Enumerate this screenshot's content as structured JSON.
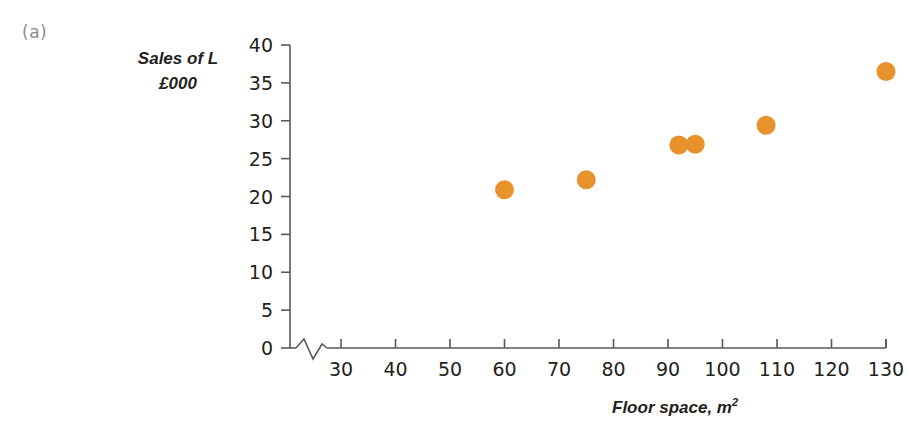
{
  "figure": {
    "panel_label": "(a)"
  },
  "chart_data": {
    "type": "scatter",
    "title": "",
    "xlabel": "Floor space, m",
    "xlabel_superscript": "2",
    "ylabel_line1": "Sales of L",
    "ylabel_line2": "£000",
    "ylabel": "Sales of L £000",
    "x": [
      60,
      75,
      92,
      95,
      108,
      130
    ],
    "values": [
      20.9,
      22.2,
      26.8,
      26.9,
      29.4,
      36.5
    ],
    "points": [
      {
        "x": 60,
        "y": 20.9
      },
      {
        "x": 75,
        "y": 22.2
      },
      {
        "x": 92,
        "y": 26.8
      },
      {
        "x": 95,
        "y": 26.9
      },
      {
        "x": 108,
        "y": 29.4
      },
      {
        "x": 130,
        "y": 36.5
      }
    ],
    "xlim": [
      25,
      130
    ],
    "ylim": [
      0,
      40
    ],
    "xticks": [
      30,
      40,
      50,
      60,
      70,
      80,
      90,
      100,
      110,
      120,
      130
    ],
    "yticks": [
      0,
      5,
      10,
      15,
      20,
      25,
      30,
      35,
      40
    ],
    "xtick_labels": [
      "30",
      "40",
      "50",
      "60",
      "70",
      "80",
      "90",
      "100",
      "110",
      "120",
      "130"
    ],
    "ytick_labels": [
      "0",
      "5",
      "10",
      "15",
      "20",
      "25",
      "30",
      "35",
      "40"
    ],
    "grid": false,
    "legend": null,
    "axis_break": {
      "axis": "x",
      "style": "zigzag",
      "between": [
        0,
        30
      ]
    },
    "marker_color": "#e8922b",
    "marker_shape": "circle",
    "axis_color": "#58595b",
    "text_color": "#231f20"
  }
}
